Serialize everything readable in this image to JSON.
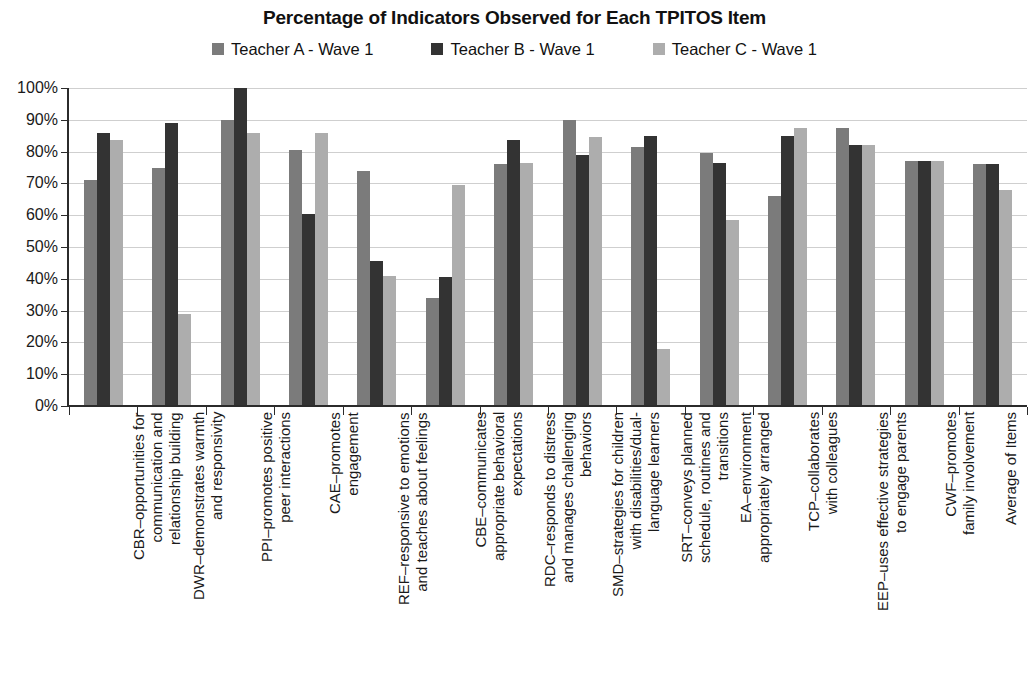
{
  "chart_data": {
    "type": "bar",
    "title": "Percentage of Indicators Observed for Each TPITOS Item",
    "xlabel": "",
    "ylabel": "",
    "ylim": [
      0,
      100
    ],
    "y_unit": "%",
    "grid": true,
    "legend_position": "top",
    "y_ticks": [
      "0%",
      "10%",
      "20%",
      "30%",
      "40%",
      "50%",
      "60%",
      "70%",
      "80%",
      "90%",
      "100%"
    ],
    "y_tick_values": [
      0,
      10,
      20,
      30,
      40,
      50,
      60,
      70,
      80,
      90,
      100
    ],
    "categories": [
      "CBR–opportunities for communication and relationship building",
      "DWR–demonstrates warmth and responsivity",
      "PPI–promotes positive peer interactions",
      "CAE–promotes engagement",
      "REF–responsive to emotions and teaches about feelings",
      "CBE–communicates appropriate behavioral expectations",
      "RDC–responds to distress and manages challenging behaviors",
      "SMD–strategies for children with disabilities/dual-language learners",
      "SRT–conveys planned schedule, routines and transitions",
      "EA–environment appropriately arranged",
      "TCP–collaborates with colleagues",
      "EEP–uses effective strategies to engage parents",
      "CWF–promotes family involvement",
      "Average of Items"
    ],
    "category_lines": [
      [
        "CBR–opportunities for",
        "communication and",
        "relationship building"
      ],
      [
        "DWR–demonstrates warmth",
        "and responsivity"
      ],
      [
        "PPI–promotes positive",
        "peer interactions"
      ],
      [
        "CAE–promotes",
        "engagement"
      ],
      [
        "REF–responsive to emotions",
        "and teaches about feelings"
      ],
      [
        "CBE–communicates",
        "appropriate behavioral",
        "expectations"
      ],
      [
        "RDC–responds to distress",
        "and manages challenging",
        "behaviors"
      ],
      [
        "SMD–strategies for children",
        "with disabilities/dual-",
        "language learners"
      ],
      [
        "SRT–conveys planned",
        "schedule, routines and",
        "transitions"
      ],
      [
        "EA–environment",
        "appropriately arranged"
      ],
      [
        "TCP–collaborates",
        "with colleagues"
      ],
      [
        "EEP–uses effective strategies",
        "to engage parents"
      ],
      [
        "CWF–promotes",
        "family involvement"
      ],
      [
        "Average of Items"
      ]
    ],
    "series": [
      {
        "name": "Teacher A - Wave 1",
        "color": "#7b7b7b",
        "values": [
          71,
          75,
          90,
          80.5,
          74,
          34,
          76,
          90,
          81.5,
          79.5,
          66,
          87.5,
          77,
          76
        ]
      },
      {
        "name": "Teacher B - Wave 1",
        "color": "#333333",
        "values": [
          86,
          89,
          100,
          60.5,
          45.5,
          40.5,
          83.5,
          79,
          85,
          76.5,
          85,
          82,
          77,
          76
        ]
      },
      {
        "name": "Teacher C - Wave 1",
        "color": "#adadad",
        "values": [
          83.5,
          29,
          86,
          86,
          41,
          69.5,
          76.5,
          84.5,
          18,
          58.5,
          87.5,
          82,
          77,
          68
        ]
      }
    ]
  },
  "legend": {
    "items": [
      {
        "label": "Teacher A - Wave 1",
        "color": "#7b7b7b"
      },
      {
        "label": "Teacher B - Wave 1",
        "color": "#333333"
      },
      {
        "label": "Teacher C - Wave 1",
        "color": "#adadad"
      }
    ]
  }
}
